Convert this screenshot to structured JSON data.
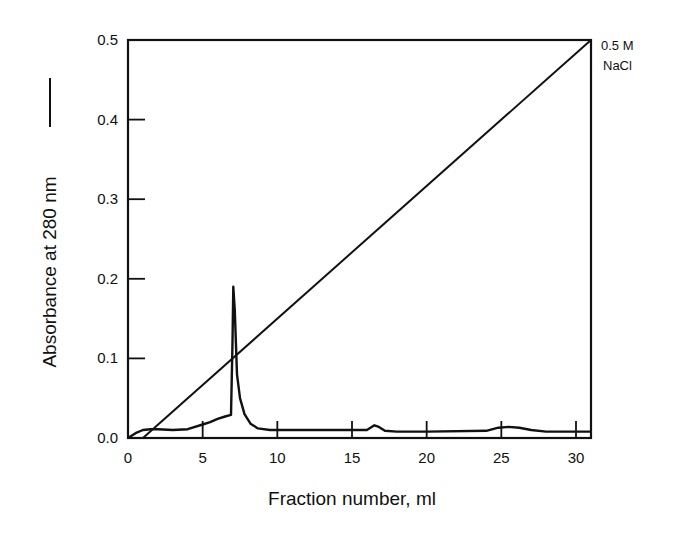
{
  "chart_data": {
    "type": "line",
    "title": "",
    "xlabel": "Fraction number, ml",
    "ylabel": "Absorbance at 280 nm",
    "ylabel_legend_marker": "solid line",
    "xlim": [
      0,
      31
    ],
    "ylim": [
      0.0,
      0.5
    ],
    "x_ticks": [
      0,
      5,
      10,
      15,
      20,
      25,
      30
    ],
    "x_tick_labels": [
      "0",
      "5",
      "10",
      "15",
      "20",
      "25",
      "30"
    ],
    "y_ticks": [
      0.0,
      0.1,
      0.2,
      0.3,
      0.4,
      0.5
    ],
    "y_tick_labels": [
      "0.0",
      "0.1",
      "0.2",
      "0.3",
      "0.4",
      "0.5"
    ],
    "grid": false,
    "legend": "none",
    "annotations": [
      {
        "text_line1": "0.5 M",
        "text_line2": "NaCl",
        "position": "right of top-right corner, marking end of gradient"
      }
    ],
    "series": [
      {
        "name": "Absorbance at 280 nm",
        "x": [
          0.0,
          0.5,
          1.0,
          1.5,
          2.0,
          3.0,
          4.0,
          5.0,
          5.5,
          6.0,
          6.5,
          6.9,
          7.0,
          7.05,
          7.15,
          7.3,
          7.5,
          7.8,
          8.2,
          8.7,
          9.5,
          10,
          12,
          15,
          16.0,
          16.5,
          16.8,
          17.2,
          18,
          20,
          24,
          24.8,
          25.5,
          26.2,
          27,
          28,
          30,
          31
        ],
        "y": [
          0.0,
          0.006,
          0.01,
          0.011,
          0.011,
          0.01,
          0.011,
          0.017,
          0.02,
          0.024,
          0.027,
          0.029,
          0.12,
          0.19,
          0.16,
          0.08,
          0.05,
          0.03,
          0.018,
          0.012,
          0.01,
          0.01,
          0.01,
          0.01,
          0.01,
          0.016,
          0.014,
          0.009,
          0.008,
          0.008,
          0.009,
          0.013,
          0.014,
          0.013,
          0.01,
          0.008,
          0.008,
          0.008
        ]
      },
      {
        "name": "NaCl gradient",
        "x": [
          1.0,
          31.0
        ],
        "y": [
          0.0,
          0.5
        ],
        "note": "linear salt gradient 0 to 0.5 M NaCl"
      }
    ]
  }
}
